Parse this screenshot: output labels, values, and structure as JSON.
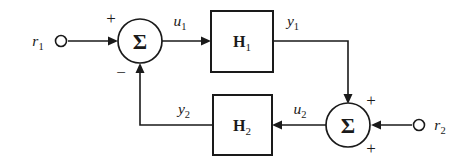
{
  "figure": {
    "kind": "control-system-block-diagram",
    "background_color": "#ffffff",
    "line_color": "#1a1a1a",
    "width": 471,
    "height": 165
  },
  "inputs": [
    {
      "id": "r1",
      "symbol": "r",
      "subscript": "1",
      "node_shape": "open-circle"
    },
    {
      "id": "r2",
      "symbol": "r",
      "subscript": "2",
      "node_shape": "open-circle"
    }
  ],
  "signals": [
    {
      "id": "u1",
      "symbol": "u",
      "subscript": "1"
    },
    {
      "id": "y1",
      "symbol": "y",
      "subscript": "1"
    },
    {
      "id": "u2",
      "symbol": "u",
      "subscript": "2"
    },
    {
      "id": "y2",
      "symbol": "y",
      "subscript": "2"
    }
  ],
  "blocks": [
    {
      "id": "H1",
      "symbol": "H",
      "subscript": "1",
      "shape": "rectangle"
    },
    {
      "id": "H2",
      "symbol": "H",
      "subscript": "2",
      "shape": "rectangle"
    }
  ],
  "summing_junctions": [
    {
      "id": "sum-left",
      "glyph": "Σ",
      "signs": [
        {
          "port": "left-input",
          "sign": "+"
        },
        {
          "port": "bottom-input",
          "sign": "−"
        }
      ]
    },
    {
      "id": "sum-right",
      "glyph": "Σ",
      "signs": [
        {
          "port": "top-input",
          "sign": "+"
        },
        {
          "port": "right-input",
          "sign": "+"
        }
      ]
    }
  ],
  "signs": {
    "plus": "+",
    "minus": "−"
  },
  "equations": {
    "left_junction": "u1 = r1 − y2",
    "right_junction": "u2 = y1 + r2",
    "forward_path": "y1 = H1 u1",
    "feedback_path": "y2 = H2 u2"
  }
}
